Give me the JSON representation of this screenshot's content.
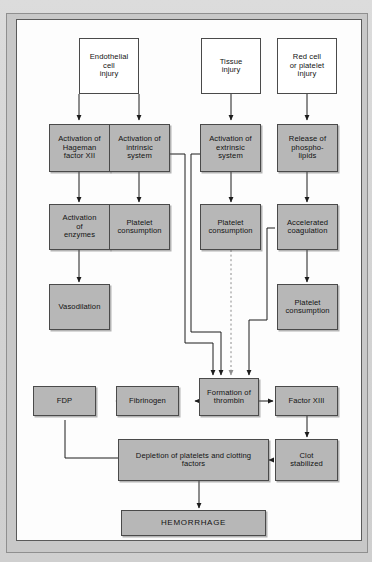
{
  "page": {
    "top_caption": "",
    "background_color": "#d9d9d9",
    "frame_color": "#c8c8c8",
    "canvas_color": "#fdfdfd"
  },
  "diagram": {
    "node_fill_gray": "#b7b7b7",
    "node_fill_white": "#ffffff",
    "node_border": "#4a4a4a",
    "nodes": [
      {
        "id": "endothelial",
        "label": "Endothelial\ncell\ninjury",
        "style": "white"
      },
      {
        "id": "tissue",
        "label": "Tissue\ninjury",
        "style": "white"
      },
      {
        "id": "redcell",
        "label": "Red cell\nor platelet\ninjury",
        "style": "white"
      },
      {
        "id": "hageman",
        "label": "Activation of\nHageman\nfactor XII",
        "style": "gray"
      },
      {
        "id": "intrinsic",
        "label": "Activation of\nintrinsic\nsystem",
        "style": "gray"
      },
      {
        "id": "extrinsic",
        "label": "Activation of\nextrinsic\nsystem",
        "style": "gray"
      },
      {
        "id": "phospholipids",
        "label": "Release of\nphospho-\nlipids",
        "style": "gray"
      },
      {
        "id": "enzymes",
        "label": "Activation\nof\nenzymes",
        "style": "gray"
      },
      {
        "id": "platelet1",
        "label": "Platelet\nconsumption",
        "style": "gray"
      },
      {
        "id": "platelet2",
        "label": "Platelet\nconsumption",
        "style": "gray"
      },
      {
        "id": "accelerated",
        "label": "Accelerated\ncoagulation",
        "style": "gray"
      },
      {
        "id": "vasodilation",
        "label": "Vasodilation",
        "style": "gray"
      },
      {
        "id": "platelet3",
        "label": "Platelet\nconsumption",
        "style": "gray"
      },
      {
        "id": "fdp",
        "label": "FDP",
        "style": "gray"
      },
      {
        "id": "fibrinogen",
        "label": "Fibrinogen",
        "style": "gray"
      },
      {
        "id": "thrombin",
        "label": "Formation of\nthrombin",
        "style": "gray"
      },
      {
        "id": "factor13",
        "label": "Factor XIII",
        "style": "gray"
      },
      {
        "id": "clot",
        "label": "Clot\nstabilized",
        "style": "gray"
      },
      {
        "id": "depletion",
        "label": "Depletion of platelets and clotting\nfactors",
        "style": "gray"
      },
      {
        "id": "hemorrhage",
        "label": "HEMORRHAGE",
        "style": "gray"
      }
    ],
    "edges": [
      {
        "from": "endothelial",
        "to": "hageman",
        "kind": "solid"
      },
      {
        "from": "endothelial",
        "to": "intrinsic",
        "kind": "solid"
      },
      {
        "from": "tissue",
        "to": "extrinsic",
        "kind": "solid"
      },
      {
        "from": "redcell",
        "to": "phospholipids",
        "kind": "solid"
      },
      {
        "from": "hageman",
        "to": "enzymes",
        "kind": "solid"
      },
      {
        "from": "intrinsic",
        "to": "platelet1",
        "kind": "solid"
      },
      {
        "from": "extrinsic",
        "to": "platelet2",
        "kind": "solid"
      },
      {
        "from": "phospholipids",
        "to": "accelerated",
        "kind": "solid"
      },
      {
        "from": "enzymes",
        "to": "vasodilation",
        "kind": "solid"
      },
      {
        "from": "accelerated",
        "to": "platelet3",
        "kind": "solid"
      },
      {
        "from": "intrinsic",
        "to": "thrombin",
        "kind": "solid"
      },
      {
        "from": "extrinsic",
        "to": "thrombin",
        "kind": "solid"
      },
      {
        "from": "platelet2",
        "to": "thrombin",
        "kind": "dotted"
      },
      {
        "from": "accelerated",
        "to": "thrombin",
        "kind": "solid"
      },
      {
        "from": "thrombin",
        "to": "fibrinogen",
        "kind": "solid"
      },
      {
        "from": "fibrinogen",
        "to": "fdp",
        "kind": "solid"
      },
      {
        "from": "thrombin",
        "to": "factor13",
        "kind": "solid"
      },
      {
        "from": "factor13",
        "to": "clot",
        "kind": "solid"
      },
      {
        "from": "fdp",
        "to": "depletion",
        "kind": "solid"
      },
      {
        "from": "clot",
        "to": "depletion",
        "kind": "solid"
      },
      {
        "from": "depletion",
        "to": "hemorrhage",
        "kind": "solid"
      }
    ]
  }
}
